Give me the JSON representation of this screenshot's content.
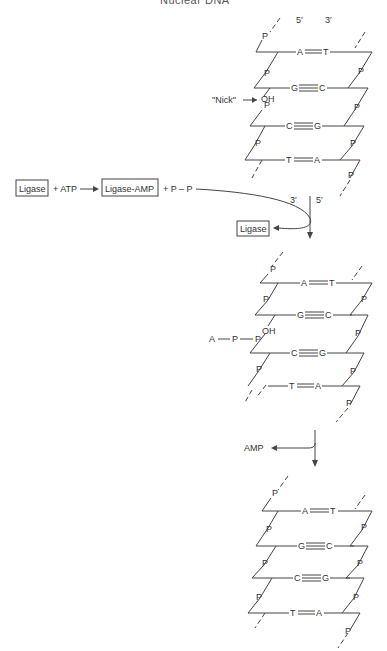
{
  "title": "Nuclear DNA",
  "top_helix": {
    "end_labels": {
      "left": "5′",
      "right": "3′"
    },
    "pairs": [
      {
        "left": "A",
        "right": "T",
        "bonds": 2
      },
      {
        "left": "G",
        "right": "C",
        "bonds": 3
      },
      {
        "left": "C",
        "right": "G",
        "bonds": 3
      },
      {
        "left": "T",
        "right": "A",
        "bonds": 2
      }
    ],
    "phosphate": "P",
    "nick_label": "\"Nick\"",
    "oh_label": "OH"
  },
  "reaction": {
    "enzyme_box": "Ligase",
    "plus_atp": "+ ATP",
    "product_box": "Ligase-AMP",
    "plus_ppi": "+ P – P",
    "released_box": "Ligase",
    "end_labels": {
      "left": "3′",
      "right": "5′"
    }
  },
  "middle_helix": {
    "pairs": [
      {
        "left": "A",
        "right": "T",
        "bonds": 2
      },
      {
        "left": "G",
        "right": "C",
        "bonds": 3
      },
      {
        "left": "C",
        "right": "G",
        "bonds": 3
      },
      {
        "left": "T",
        "right": "A",
        "bonds": 2
      }
    ],
    "phosphate": "P",
    "oh_label": "OH",
    "adenylate_chain": {
      "a": "A",
      "p1": "P",
      "p2": "P"
    }
  },
  "release": {
    "amp_label": "AMP"
  },
  "bottom_helix": {
    "pairs": [
      {
        "left": "A",
        "right": "T",
        "bonds": 2
      },
      {
        "left": "G",
        "right": "C",
        "bonds": 3
      },
      {
        "left": "C",
        "right": "G",
        "bonds": 3
      },
      {
        "left": "T",
        "right": "A",
        "bonds": 2
      }
    ],
    "phosphate": "P"
  }
}
